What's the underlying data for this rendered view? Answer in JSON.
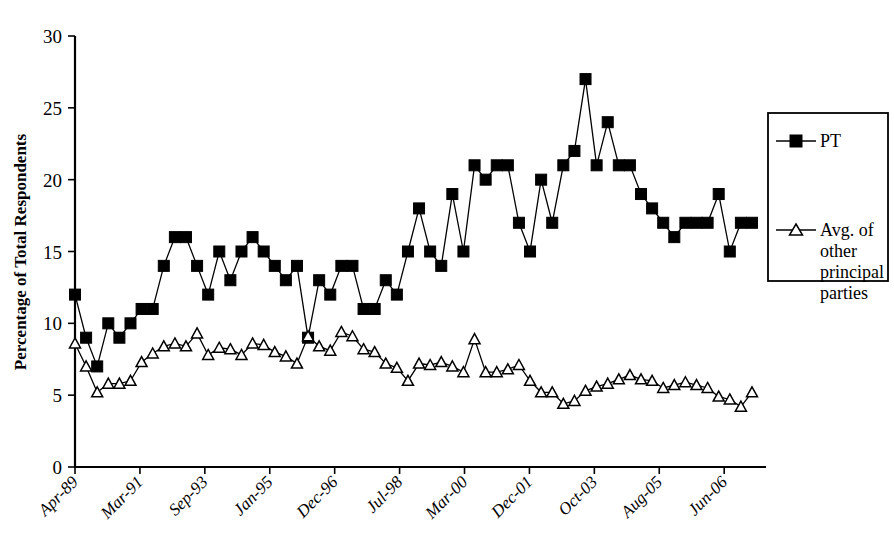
{
  "chart_data": {
    "type": "line",
    "title": "",
    "xlabel": "",
    "ylabel": "Percentage of Total Respondents",
    "ylim": [
      0,
      30
    ],
    "yticks": [
      0,
      5,
      10,
      15,
      20,
      25,
      30
    ],
    "grid": false,
    "legend_position": "right",
    "x_tick_labels": [
      "Apr-89",
      "Mar-91",
      "Sep-93",
      "Jan-95",
      "Dec-96",
      "Jul-98",
      "Mar-00",
      "Dec-01",
      "Oct-03",
      "Aug-05",
      "Jun-06"
    ],
    "x_tick_indices": [
      0,
      7,
      14,
      21,
      28,
      35,
      42,
      49,
      56,
      63,
      70
    ],
    "n_points": 74,
    "series": [
      {
        "name": "PT",
        "marker": "filled-square",
        "values": [
          12,
          9,
          7,
          10,
          9,
          10,
          11,
          11,
          14,
          16,
          16,
          14,
          12,
          15,
          13,
          15,
          16,
          15,
          14,
          13,
          14,
          9,
          13,
          12,
          14,
          14,
          11,
          11,
          13,
          12,
          15,
          18,
          15,
          14,
          19,
          15,
          21,
          20,
          21,
          21,
          17,
          15,
          20,
          17,
          21,
          22,
          27,
          21,
          24,
          21,
          21,
          19,
          18,
          17,
          16,
          17,
          17,
          17,
          19,
          15,
          17,
          17
        ]
      },
      {
        "name": "Avg. of other principal parties",
        "marker": "open-triangle",
        "values": [
          8.6,
          7.0,
          5.2,
          5.8,
          5.8,
          6.0,
          7.3,
          7.9,
          8.4,
          8.6,
          8.4,
          9.3,
          7.8,
          8.3,
          8.2,
          7.8,
          8.6,
          8.5,
          8.0,
          7.7,
          7.2,
          9.1,
          8.4,
          8.1,
          9.4,
          9.1,
          8.2,
          8.0,
          7.2,
          6.9,
          6.0,
          7.2,
          7.1,
          7.3,
          7.0,
          6.6,
          8.9,
          6.6,
          6.6,
          6.8,
          7.1,
          6.0,
          5.2,
          5.2,
          4.4,
          4.6,
          5.3,
          5.6,
          5.8,
          6.1,
          6.4,
          6.1,
          6.0,
          5.5,
          5.7,
          5.9,
          5.7,
          5.5,
          4.9,
          4.7,
          4.2,
          5.2
        ]
      }
    ],
    "legend": [
      {
        "label": "PT",
        "marker": "filled-square"
      },
      {
        "label": "Avg. of\nother\nprincipal\nparties",
        "marker": "open-triangle",
        "lines": [
          "Avg. of",
          "other",
          "principal",
          "parties"
        ]
      }
    ],
    "colors": {
      "series": "#000000",
      "axis": "#000000",
      "background": "#ffffff"
    }
  }
}
